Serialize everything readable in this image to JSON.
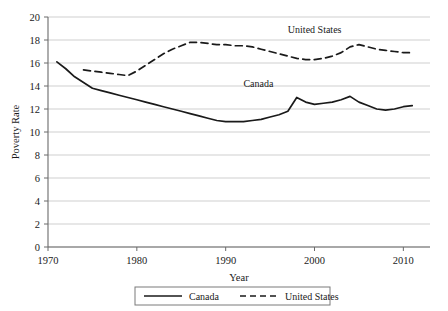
{
  "chart_data": {
    "type": "line",
    "title": "",
    "xlabel": "Year",
    "ylabel": "Poverty Rate",
    "xlim": [
      1970,
      2013
    ],
    "ylim": [
      0,
      20
    ],
    "xticks": [
      1970,
      1980,
      1990,
      2000,
      2010
    ],
    "yticks": [
      0,
      2,
      4,
      6,
      8,
      10,
      12,
      14,
      16,
      18,
      20
    ],
    "grid": "horizontal",
    "legend_position": "bottom-center",
    "inline_annotations": [
      {
        "text": "United States",
        "x": 1997,
        "y": 18.6
      },
      {
        "text": "Canada",
        "x": 1992,
        "y": 13.9
      }
    ],
    "series": [
      {
        "name": "Canada",
        "style": "solid",
        "color": "#1a1a1a",
        "points": [
          [
            1971,
            16.1
          ],
          [
            1972,
            15.5
          ],
          [
            1973,
            14.8
          ],
          [
            1974,
            14.3
          ],
          [
            1975,
            13.8
          ],
          [
            1976,
            13.6
          ],
          [
            1977,
            13.4
          ],
          [
            1978,
            13.2
          ],
          [
            1979,
            13.0
          ],
          [
            1980,
            12.8
          ],
          [
            1981,
            12.6
          ],
          [
            1982,
            12.4
          ],
          [
            1983,
            12.2
          ],
          [
            1984,
            12.0
          ],
          [
            1985,
            11.8
          ],
          [
            1986,
            11.6
          ],
          [
            1987,
            11.4
          ],
          [
            1988,
            11.2
          ],
          [
            1989,
            11.0
          ],
          [
            1990,
            10.9
          ],
          [
            1991,
            10.9
          ],
          [
            1992,
            10.9
          ],
          [
            1993,
            11.0
          ],
          [
            1994,
            11.1
          ],
          [
            1995,
            11.3
          ],
          [
            1996,
            11.5
          ],
          [
            1997,
            11.8
          ],
          [
            1998,
            13.0
          ],
          [
            1999,
            12.6
          ],
          [
            2000,
            12.4
          ],
          [
            2001,
            12.5
          ],
          [
            2002,
            12.6
          ],
          [
            2003,
            12.8
          ],
          [
            2004,
            13.1
          ],
          [
            2005,
            12.6
          ],
          [
            2006,
            12.3
          ],
          [
            2007,
            12.0
          ],
          [
            2008,
            11.9
          ],
          [
            2009,
            12.0
          ],
          [
            2010,
            12.2
          ],
          [
            2011,
            12.3
          ]
        ]
      },
      {
        "name": "United States",
        "style": "dashed",
        "color": "#1a1a1a",
        "points": [
          [
            1974,
            15.4
          ],
          [
            1975,
            15.3
          ],
          [
            1976,
            15.2
          ],
          [
            1977,
            15.1
          ],
          [
            1978,
            15.0
          ],
          [
            1979,
            14.9
          ],
          [
            1980,
            15.3
          ],
          [
            1981,
            15.8
          ],
          [
            1982,
            16.3
          ],
          [
            1983,
            16.8
          ],
          [
            1984,
            17.2
          ],
          [
            1985,
            17.5
          ],
          [
            1986,
            17.8
          ],
          [
            1987,
            17.8
          ],
          [
            1988,
            17.7
          ],
          [
            1989,
            17.6
          ],
          [
            1990,
            17.6
          ],
          [
            1991,
            17.5
          ],
          [
            1992,
            17.5
          ],
          [
            1993,
            17.4
          ],
          [
            1994,
            17.2
          ],
          [
            1995,
            17.0
          ],
          [
            1996,
            16.8
          ],
          [
            1997,
            16.6
          ],
          [
            1998,
            16.4
          ],
          [
            1999,
            16.3
          ],
          [
            2000,
            16.3
          ],
          [
            2001,
            16.4
          ],
          [
            2002,
            16.6
          ],
          [
            2003,
            16.9
          ],
          [
            2004,
            17.4
          ],
          [
            2005,
            17.6
          ],
          [
            2006,
            17.4
          ],
          [
            2007,
            17.2
          ],
          [
            2008,
            17.1
          ],
          [
            2009,
            17.0
          ],
          [
            2010,
            16.9
          ],
          [
            2011,
            16.9
          ]
        ]
      }
    ]
  },
  "legend": {
    "entries": [
      {
        "label": "Canada",
        "style": "solid"
      },
      {
        "label": "United States",
        "style": "dashed"
      }
    ]
  }
}
